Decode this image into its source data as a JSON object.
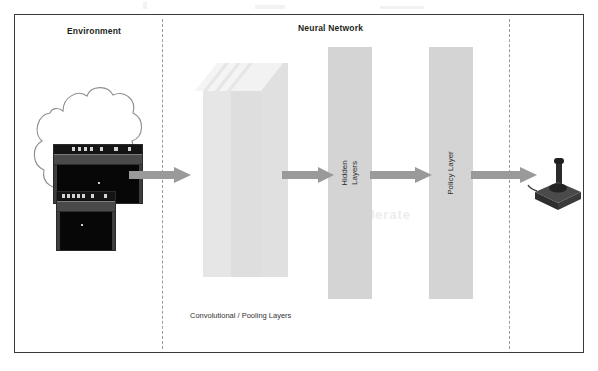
{
  "figure": {
    "type": "deep-reinforcement-learning-architecture-diagram",
    "sections": {
      "environment_title": "Environment",
      "neural_network_title": "Neural Network"
    },
    "labels": {
      "conv_pooling": "Convolutional / Pooling Layers",
      "hidden_layers": "Hidden\nLayers",
      "policy_layer": "Policy Layer"
    },
    "colors": {
      "frame_border": "#3a3a3a",
      "divider": "#9a9a9a",
      "block_fill": "#d4d4d4",
      "conv_sheet_fill": "#e3e3e3",
      "conv_sheet_edge": "#f2f2f2",
      "arrow_fill": "#9a9a9a",
      "title_text": "#231f20",
      "label_text": "#333333",
      "screen_black": "#111111",
      "joystick_body": "#3a3a3a"
    },
    "flow": [
      "Environment (Atari game frames)",
      "Convolutional / Pooling Layers",
      "Hidden Layers",
      "Policy Layer",
      "Action (joystick)"
    ],
    "counts": {
      "conv_sheets": 4,
      "game_screens": 2,
      "arrows": 4,
      "dashed_dividers": 2
    },
    "icons": {
      "cloud": "cloud-shape",
      "joystick": "atari-joystick-icon",
      "arrow": "right-arrow-icon"
    }
  }
}
